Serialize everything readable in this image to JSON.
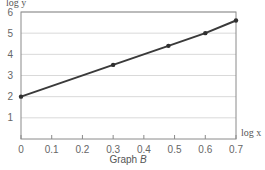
{
  "chart_data": {
    "type": "line",
    "title": "",
    "caption": "Graph B",
    "caption_prefix": "Graph ",
    "caption_letter": "B",
    "xlabel": "log x",
    "ylabel": "log y",
    "xlim": [
      0,
      0.7
    ],
    "ylim": [
      0,
      6
    ],
    "grid": {
      "horizontal": true,
      "vertical": false
    },
    "x_ticks": [
      "0",
      "0.1",
      "0.2",
      "0.3",
      "0.4",
      "0.5",
      "0.6",
      "0.7"
    ],
    "y_ticks": [
      "1",
      "2",
      "3",
      "4",
      "5",
      "6"
    ],
    "series": [
      {
        "name": "Graph B",
        "x": [
          0,
          0.3,
          0.48,
          0.6,
          0.7
        ],
        "y": [
          2.0,
          3.5,
          4.4,
          5.0,
          5.6
        ]
      }
    ],
    "legend": null
  },
  "colors": {
    "line": "#3a3a3a",
    "marker": "#2f2f2f",
    "frame": "#8a8a8a",
    "grid": "#d9d9d9"
  }
}
